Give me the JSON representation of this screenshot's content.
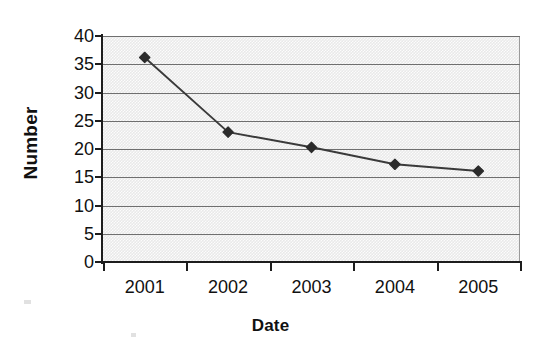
{
  "chart_data": {
    "type": "line",
    "title": "",
    "subtitle": "",
    "xlabel": "Date",
    "ylabel": "Number",
    "categories": [
      "2001",
      "2002",
      "2003",
      "2004",
      "2005"
    ],
    "values": [
      36.2,
      23.0,
      20.3,
      17.3,
      16.1
    ],
    "series": [
      {
        "name": "Number",
        "values": [
          36.2,
          23.0,
          20.3,
          17.3,
          16.1
        ]
      }
    ],
    "ylim": [
      0,
      40
    ],
    "y_ticks": [
      0,
      5,
      10,
      15,
      20,
      25,
      30,
      35,
      40
    ],
    "y_tick_labels": [
      "0",
      "5",
      "10",
      "15",
      "20",
      "25",
      "30",
      "35",
      "40"
    ],
    "x_tick_labels": [
      "2001",
      "2002",
      "2003",
      "2004",
      "2005"
    ],
    "grid": "horizontal",
    "legend": "none",
    "legend_entries": [],
    "annotations": [],
    "marker": "diamond",
    "colors": {
      "line": "#3a3a3a",
      "marker": "#2b2b2b",
      "gridline": "#6f6f6f",
      "plot_background": "#e9e9e9",
      "axis": "#1d1d1d",
      "text": "#111111",
      "chart_background": "#ffffff"
    }
  }
}
